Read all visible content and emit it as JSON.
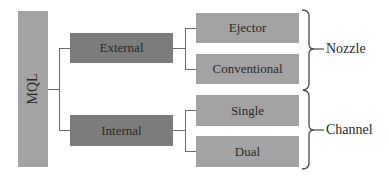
{
  "diagram": {
    "root": {
      "label": "MQL"
    },
    "level1": [
      {
        "label": "External",
        "children": [
          "Ejector",
          "Conventional"
        ]
      },
      {
        "label": "Internal",
        "children": [
          "Single",
          "Dual"
        ]
      }
    ],
    "leaves": [
      {
        "label": "Ejector"
      },
      {
        "label": "Conventional"
      },
      {
        "label": "Single"
      },
      {
        "label": "Dual"
      }
    ],
    "groups": [
      {
        "label": "Nozzle",
        "covers": [
          "Ejector",
          "Conventional"
        ]
      },
      {
        "label": "Channel",
        "covers": [
          "Single",
          "Dual"
        ]
      }
    ],
    "colors": {
      "root_and_leaves": "#a3a3a3",
      "level1": "#7c7c7c",
      "lines": "#6a6a6a"
    }
  }
}
